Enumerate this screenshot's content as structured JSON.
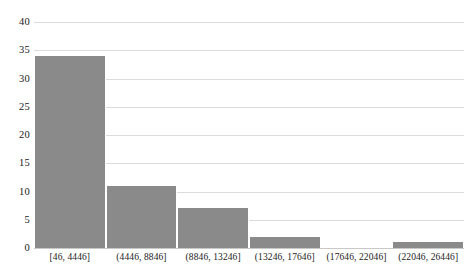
{
  "chart_data": {
    "type": "bar",
    "title": "",
    "subtitle": "",
    "xlabel": "",
    "ylabel": "",
    "categories": [
      "[46, 4446]",
      "(4446, 8846]",
      "(8846, 13246]",
      "(13246, 17646]",
      "(17646, 22046]",
      "(22046, 26446]"
    ],
    "values": [
      34,
      11,
      7,
      2,
      0,
      1
    ],
    "ylim": [
      0,
      40
    ],
    "ytick_step": 5,
    "yticks": [
      0,
      5,
      10,
      15,
      20,
      25,
      30,
      35,
      40
    ],
    "ytick_labels": [
      "0",
      "5",
      "10",
      "15",
      "20",
      "25",
      "30",
      "35",
      "40"
    ],
    "grid": "horizontal",
    "legend": "none",
    "bar_color": "#8a8a8a",
    "gridline_color": "#dcdcdc",
    "background_color": "#ffffff",
    "text_color": "#1a1a1a"
  }
}
